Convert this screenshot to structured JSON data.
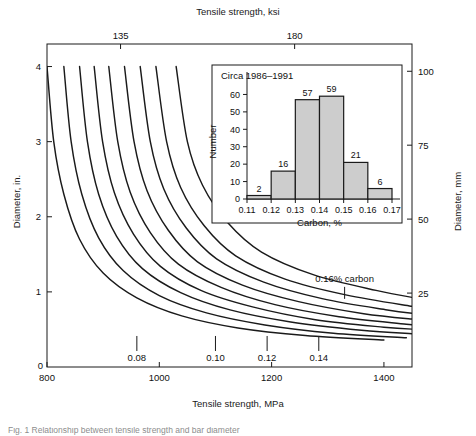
{
  "figure": {
    "top_axis_title": "Tensile strength, ksi",
    "bottom_axis_title": "Tensile strength, MPa",
    "left_axis_title": "Diameter, in.",
    "right_axis_title": "Diameter, mm",
    "caption": "Fig. 1  Relationship between tensile strength and bar diameter"
  },
  "chart_data": {
    "type": "line",
    "title": "",
    "xlabel": "Tensile strength, MPa",
    "ylabel": "Diameter, in.",
    "xlim": [
      800,
      1450
    ],
    "ylim": [
      0,
      4.3
    ],
    "grid": false,
    "legend": "none",
    "x_ticks": [
      800,
      1000,
      1200,
      1400
    ],
    "x_tick_labels": [
      "800",
      "1000",
      "1200",
      "1400"
    ],
    "y_ticks": [
      1,
      2,
      3,
      4
    ],
    "y_tick_labels": [
      "1",
      "2",
      "3",
      "4"
    ],
    "secondary_x": {
      "label": "Tensile strength, ksi",
      "ticks_mpa": [
        931,
        1241
      ],
      "tick_labels": [
        "135",
        "180"
      ]
    },
    "secondary_y": {
      "label": "Diameter, mm",
      "ticks_in": [
        0.984,
        1.969,
        2.953,
        3.937
      ],
      "tick_labels": [
        "25",
        "50",
        "75",
        "100"
      ]
    },
    "series": [
      {
        "name": "curve-1",
        "label": "",
        "points": [
          [
            800,
            4.0
          ],
          [
            812,
            3.0
          ],
          [
            830,
            2.3
          ],
          [
            858,
            1.7
          ],
          [
            900,
            1.25
          ],
          [
            960,
            0.92
          ],
          [
            1040,
            0.68
          ],
          [
            1140,
            0.52
          ],
          [
            1260,
            0.42
          ],
          [
            1400,
            0.36
          ]
        ]
      },
      {
        "name": "curve-2",
        "label": "0.08",
        "annotation_x": 960,
        "points": [
          [
            830,
            4.0
          ],
          [
            843,
            3.0
          ],
          [
            862,
            2.3
          ],
          [
            892,
            1.72
          ],
          [
            936,
            1.28
          ],
          [
            1000,
            0.95
          ],
          [
            1084,
            0.72
          ],
          [
            1188,
            0.56
          ],
          [
            1310,
            0.45
          ],
          [
            1440,
            0.39
          ]
        ]
      },
      {
        "name": "curve-3",
        "label": "",
        "points": [
          [
            858,
            4.0
          ],
          [
            872,
            3.0
          ],
          [
            892,
            2.3
          ],
          [
            924,
            1.74
          ],
          [
            970,
            1.31
          ],
          [
            1038,
            0.99
          ],
          [
            1126,
            0.76
          ],
          [
            1234,
            0.6
          ],
          [
            1360,
            0.49
          ],
          [
            1455,
            0.44
          ]
        ]
      },
      {
        "name": "curve-4",
        "label": "",
        "points": [
          [
            884,
            4.0
          ],
          [
            899,
            3.0
          ],
          [
            920,
            2.32
          ],
          [
            954,
            1.77
          ],
          [
            1002,
            1.34
          ],
          [
            1074,
            1.02
          ],
          [
            1166,
            0.8
          ],
          [
            1278,
            0.63
          ],
          [
            1400,
            0.53
          ],
          [
            1460,
            0.5
          ]
        ]
      },
      {
        "name": "curve-5",
        "label": "0.10",
        "annotation_x": 1100,
        "points": [
          [
            910,
            4.0
          ],
          [
            926,
            3.0
          ],
          [
            948,
            2.33
          ],
          [
            984,
            1.79
          ],
          [
            1034,
            1.37
          ],
          [
            1110,
            1.06
          ],
          [
            1206,
            0.83
          ],
          [
            1320,
            0.67
          ],
          [
            1440,
            0.57
          ],
          [
            1465,
            0.55
          ]
        ]
      },
      {
        "name": "curve-6",
        "label": "",
        "points": [
          [
            938,
            4.0
          ],
          [
            955,
            3.0
          ],
          [
            978,
            2.35
          ],
          [
            1016,
            1.82
          ],
          [
            1068,
            1.4
          ],
          [
            1148,
            1.09
          ],
          [
            1248,
            0.87
          ],
          [
            1364,
            0.71
          ],
          [
            1462,
            0.63
          ]
        ]
      },
      {
        "name": "curve-7",
        "label": "0.12",
        "annotation_x": 1192,
        "points": [
          [
            966,
            4.0
          ],
          [
            984,
            3.0
          ],
          [
            1008,
            2.37
          ],
          [
            1048,
            1.85
          ],
          [
            1102,
            1.44
          ],
          [
            1186,
            1.13
          ],
          [
            1290,
            0.91
          ],
          [
            1406,
            0.76
          ],
          [
            1468,
            0.7
          ]
        ]
      },
      {
        "name": "curve-8",
        "label": "",
        "points": [
          [
            994,
            4.0
          ],
          [
            1013,
            3.0
          ],
          [
            1038,
            2.39
          ],
          [
            1080,
            1.88
          ],
          [
            1136,
            1.48
          ],
          [
            1224,
            1.17
          ],
          [
            1332,
            0.96
          ],
          [
            1448,
            0.81
          ],
          [
            1472,
            0.79
          ]
        ]
      },
      {
        "name": "curve-9",
        "label": "0.14",
        "annotation_x": 1284,
        "points": [
          [
            1030,
            4.0
          ],
          [
            1050,
            3.0
          ],
          [
            1077,
            2.42
          ],
          [
            1122,
            1.92
          ],
          [
            1182,
            1.53
          ],
          [
            1274,
            1.23
          ],
          [
            1386,
            1.02
          ],
          [
            1470,
            0.9
          ]
        ]
      }
    ],
    "curve_labels": [
      {
        "text": "0.08",
        "x": 960,
        "y": 0.2
      },
      {
        "text": "0.10",
        "x": 1100,
        "y": 0.2
      },
      {
        "text": "0.12",
        "x": 1192,
        "y": 0.2
      },
      {
        "text": "0.14",
        "x": 1284,
        "y": 0.2
      },
      {
        "text": "0.16% carbon",
        "x": 1330,
        "y": 1.08
      }
    ]
  },
  "inset": {
    "annotation": "Circa 1986–1991",
    "chart_data": {
      "type": "bar",
      "title": "",
      "xlabel": "Carbon, %",
      "ylabel": "Number",
      "categories": [
        "0.11",
        "0.12",
        "0.13",
        "0.14",
        "0.15",
        "0.16",
        "0.17"
      ],
      "bin_edges": [
        0.11,
        0.12,
        0.13,
        0.14,
        0.15,
        0.16,
        0.17
      ],
      "values": [
        2,
        16,
        57,
        59,
        21,
        6
      ],
      "bar_labels": [
        "2",
        "16",
        "57",
        "59",
        "21",
        "6"
      ],
      "ylim": [
        0,
        66
      ],
      "y_ticks": [
        0,
        10,
        20,
        30,
        40,
        50,
        60
      ],
      "y_tick_labels": [
        "0",
        "10",
        "20",
        "30",
        "40",
        "50",
        "60"
      ],
      "x_tick_labels": [
        "0.11",
        "0.12",
        "0.13",
        "0.14",
        "0.15",
        "0.16",
        "0.17"
      ],
      "grid": false,
      "legend": "none",
      "bar_fill": "#cdcdcd",
      "bar_edge": "#1a1a1a"
    }
  }
}
